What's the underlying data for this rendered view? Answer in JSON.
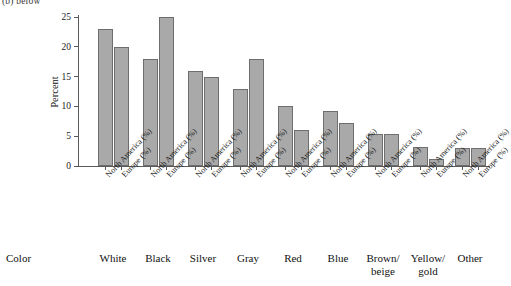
{
  "figure": {
    "caption_fragment": "(b) below",
    "axis_row_title": "Color"
  },
  "chart_data": {
    "type": "bar",
    "title": "",
    "xlabel": "Color",
    "ylabel": "Percent",
    "ylim": [
      0,
      25
    ],
    "yticks": [
      0,
      5,
      10,
      15,
      20,
      25
    ],
    "grid": false,
    "legend": "none",
    "categories": [
      "White",
      "Black",
      "Silver",
      "Gray",
      "Red",
      "Blue",
      "Brown/ beige",
      "Yellow/ gold",
      "Other"
    ],
    "tick_labels": [
      "North America (%)",
      "Europe (%)",
      "North America (%)",
      "Europe (%)",
      "North America (%)",
      "Europe (%)",
      "North America (%)",
      "Europe (%)",
      "North America (%)",
      "Europe (%)",
      "North America (%)",
      "Europe (%)",
      "North America (%)",
      "Europe (%)",
      "North America (%)",
      "Europe (%)",
      "North America (%)",
      "Europe (%)"
    ],
    "series": [
      {
        "name": "North America (%)",
        "values": [
          23,
          18,
          16,
          13,
          10,
          9.3,
          5.3,
          3.2,
          3.1
        ]
      },
      {
        "name": "Europe (%)",
        "values": [
          20,
          25,
          15,
          18,
          6,
          7.2,
          5.3,
          1.2,
          3.1
        ]
      }
    ],
    "bar_color": "#a9a9a9",
    "bar_edge_color": "#6e6e6e"
  },
  "groups": [
    {
      "label": "White",
      "na": 23,
      "eu": 20,
      "center": 113
    },
    {
      "label": "Black",
      "na": 18,
      "eu": 25,
      "center": 158
    },
    {
      "label": "Silver",
      "na": 16,
      "eu": 15,
      "center": 203
    },
    {
      "label": "Gray",
      "na": 13,
      "eu": 18,
      "center": 248
    },
    {
      "label": "Red",
      "na": 10,
      "eu": 6,
      "center": 293
    },
    {
      "label": "Blue",
      "na": 9.3,
      "eu": 7.2,
      "center": 338
    },
    {
      "label": "Brown/ beige",
      "na": 5.3,
      "eu": 5.3,
      "center": 383
    },
    {
      "label": "Yellow/ gold",
      "na": 3.2,
      "eu": 1.2,
      "center": 428
    },
    {
      "label": "Other",
      "na": 3.1,
      "eu": 3.1,
      "center": 470
    }
  ]
}
